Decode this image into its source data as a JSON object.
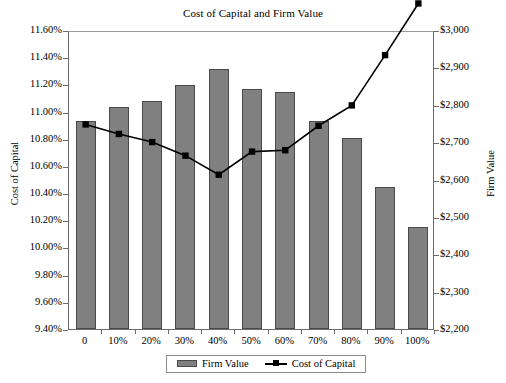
{
  "chart_data": {
    "type": "bar",
    "title": "Cost of Capital and Firm Value",
    "xlabel": "",
    "categories": [
      "0",
      "10%",
      "20%",
      "30%",
      "40%",
      "50%",
      "60%",
      "70%",
      "80%",
      "90%",
      "100%"
    ],
    "grid": false,
    "legend_position": "bottom",
    "series": [
      {
        "name": "Firm Value",
        "type": "bar",
        "axis": "right",
        "color": "#808080",
        "values": [
          2757,
          2795,
          2811,
          2854,
          2897,
          2843,
          2835,
          2757,
          2712,
          2580,
          2473
        ]
      },
      {
        "name": "Cost of Capital",
        "type": "line",
        "axis": "left",
        "color": "#000000",
        "values": [
          0.1092,
          0.1085,
          0.1079,
          0.1069,
          0.1055,
          0.1072,
          0.1073,
          0.1091,
          0.1106,
          0.1143,
          0.1181
        ]
      }
    ],
    "left_axis": {
      "label": "Cost of Capital",
      "ylim": [
        0.094,
        0.116
      ],
      "tick_labels": [
        "11.60%",
        "11.40%",
        "11.20%",
        "11.00%",
        "10.80%",
        "10.60%",
        "10.40%",
        "10.20%",
        "10.00%",
        "9.80%",
        "9.60%",
        "9.40%"
      ],
      "tick_values": [
        0.116,
        0.114,
        0.112,
        0.11,
        0.108,
        0.106,
        0.104,
        0.102,
        0.1,
        0.098,
        0.096,
        0.094
      ]
    },
    "right_axis": {
      "label": "Firm Value",
      "ylim": [
        2200,
        3000
      ],
      "tick_labels": [
        "$3,000",
        "$2,900",
        "$2,800",
        "$2,700",
        "$2,600",
        "$2,500",
        "$2,400",
        "$2,300",
        "$2,200"
      ],
      "tick_values": [
        3000,
        2900,
        2800,
        2700,
        2600,
        2500,
        2400,
        2300,
        2200
      ]
    },
    "legend": [
      "Firm Value",
      "Cost of Capital"
    ]
  }
}
